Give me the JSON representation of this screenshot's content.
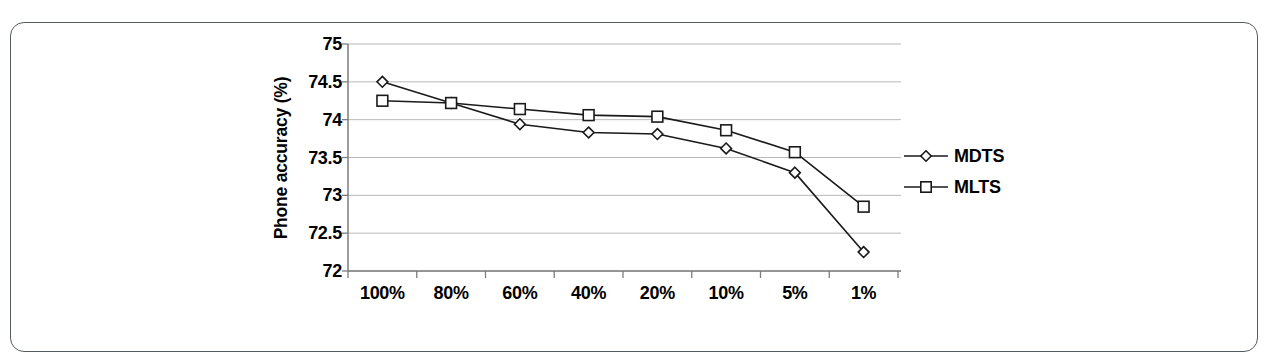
{
  "figure": {
    "background_color": "#ffffff",
    "frame_color": "#555b60",
    "line_color": "#1a1a1a",
    "grid_color": "#b9b9b9",
    "axis_color": "#7d7d7d"
  },
  "chart_data": {
    "type": "line",
    "title": "",
    "xlabel": "",
    "ylabel": "Phone accuracy (%)",
    "categories": [
      "100%",
      "80%",
      "60%",
      "40%",
      "20%",
      "10%",
      "5%",
      "1%"
    ],
    "yticks": [
      "75",
      "74.5",
      "74",
      "73.5",
      "73",
      "72.5",
      "72"
    ],
    "ytick_values": [
      75,
      74.5,
      74,
      73.5,
      73,
      72.5,
      72
    ],
    "ylim": [
      72,
      75
    ],
    "grid": "horizontal",
    "legend_position": "right",
    "series": [
      {
        "name": "MDTS",
        "marker": "diamond",
        "values": [
          74.5,
          74.22,
          73.94,
          73.83,
          73.81,
          73.62,
          73.3,
          72.25
        ]
      },
      {
        "name": "MLTS",
        "marker": "square",
        "values": [
          74.25,
          74.22,
          74.14,
          74.06,
          74.04,
          73.86,
          73.57,
          72.85
        ]
      }
    ]
  },
  "legend": {
    "items": [
      {
        "label": "MDTS",
        "marker": "diamond-marker-icon"
      },
      {
        "label": "MLTS",
        "marker": "square-marker-icon"
      }
    ]
  }
}
